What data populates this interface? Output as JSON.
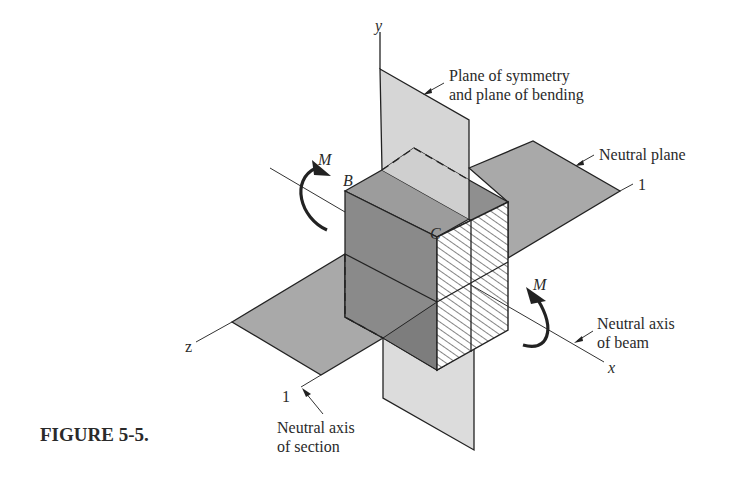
{
  "figure": {
    "caption": "FIGURE 5-5.",
    "axes": {
      "x": "x",
      "y": "y",
      "z": "z"
    },
    "points": {
      "B": "B",
      "C": "C"
    },
    "moments": {
      "left": "M",
      "right": "M"
    },
    "neutral_axis_marks": {
      "right": "1",
      "left": "1"
    },
    "callouts": {
      "symmetry_line1": "Plane of symmetry",
      "symmetry_line2": "and plane of bending",
      "neutral_plane": "Neutral plane",
      "beam_axis_line1": "Neutral axis",
      "beam_axis_line2": "of beam",
      "section_axis_line1": "Neutral axis",
      "section_axis_line2": "of section"
    },
    "colors": {
      "vertical_plane": "#d6d6d6",
      "horizontal_plane": "#a9a9a9",
      "box_left_face": "#8a8a8a",
      "box_top_face": "#9c9c9c",
      "hatched_face": "#ffffff",
      "ink": "#222222"
    }
  }
}
